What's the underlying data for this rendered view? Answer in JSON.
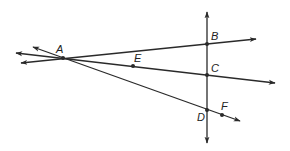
{
  "diagram": {
    "type": "geometry",
    "colors": {
      "stroke": "#2a2a2a",
      "label": "#222222",
      "background": "#ffffff"
    },
    "points": [
      {
        "id": "A",
        "label": "A",
        "x": 63,
        "y": 58,
        "lx": 56,
        "ly": 53
      },
      {
        "id": "B",
        "label": "B",
        "x": 207,
        "y": 44,
        "lx": 211,
        "ly": 40
      },
      {
        "id": "C",
        "label": "C",
        "x": 207,
        "y": 75,
        "lx": 211,
        "ly": 72
      },
      {
        "id": "D",
        "label": "D",
        "x": 207,
        "y": 110,
        "lx": 197,
        "ly": 121
      },
      {
        "id": "E",
        "label": "E",
        "x": 133,
        "y": 66,
        "lx": 134,
        "ly": 62
      },
      {
        "id": "F",
        "label": "F",
        "x": 222,
        "y": 115,
        "lx": 221,
        "ly": 110
      }
    ],
    "lines": [
      {
        "id": "line-AB",
        "through": [
          "A",
          "B"
        ],
        "x1": 21,
        "y1": 63,
        "x2": 256,
        "y2": 39
      },
      {
        "id": "line-AC",
        "through": [
          "A",
          "E",
          "C"
        ],
        "x1": 16,
        "y1": 53,
        "x2": 275,
        "y2": 83
      },
      {
        "id": "line-AD",
        "through": [
          "A",
          "D",
          "F"
        ],
        "x1": 33,
        "y1": 47,
        "x2": 240,
        "y2": 121
      },
      {
        "id": "line-BD",
        "through": [
          "B",
          "C",
          "D"
        ],
        "x1": 207,
        "y1": 12,
        "x2": 207,
        "y2": 143
      }
    ]
  }
}
